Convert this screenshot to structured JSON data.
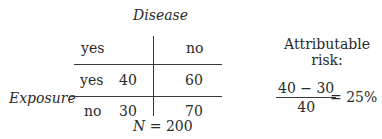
{
  "table": {
    "column_header_title": "Disease",
    "row_header_title": "Exposure",
    "column_labels": [
      "yes",
      "no"
    ],
    "rows": [
      {
        "label": "yes",
        "values": [
          "40",
          "60"
        ]
      },
      {
        "label": "no",
        "values": [
          "30",
          "70"
        ]
      }
    ],
    "total": "N = 200"
  },
  "attributable_risk": {
    "title_line1": "Attributable",
    "title_line2": "risk:",
    "numerator": "40 − 30",
    "denominator": "40",
    "result": "= 25%"
  }
}
